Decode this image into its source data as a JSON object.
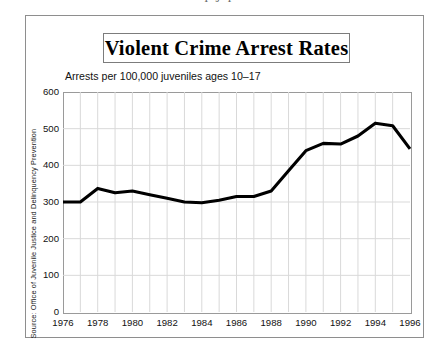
{
  "clipped_header_text": "I  J  I",
  "figure": {
    "title": "Violent Crime Arrest Rates",
    "subtitle": "Arrests per 100,000 juveniles ages 10–17",
    "source_note": "Source: Office of Juvenile Justice and Delinquency Prevention"
  },
  "colors": {
    "line": "#000000",
    "grid": "#d9d9d9",
    "axis": "#9a9a9a",
    "frame": "#8e8e8e",
    "text": "#111111",
    "background": "#ffffff"
  },
  "chart_data": {
    "type": "line",
    "title": "Violent Crime Arrest Rates",
    "subtitle": "Arrests per 100,000 juveniles ages 10–17",
    "xlabel": "",
    "ylabel": "",
    "xlim": [
      1976,
      1996
    ],
    "ylim": [
      0,
      600
    ],
    "ytick_interval": 100,
    "xtick_interval": 2,
    "grid": true,
    "grid_vertical_interval": 1,
    "legend": false,
    "yticks": [
      0,
      100,
      200,
      300,
      400,
      500,
      600
    ],
    "ytick_labels": [
      "0",
      "100",
      "200",
      "300",
      "400",
      "500",
      "600"
    ],
    "xticks": [
      1976,
      1978,
      1980,
      1982,
      1984,
      1986,
      1988,
      1990,
      1992,
      1994,
      1996
    ],
    "xtick_labels": [
      "1976",
      "1978",
      "1980",
      "1982",
      "1984",
      "1986",
      "1988",
      "1990",
      "1992",
      "1994",
      "1996"
    ],
    "x": [
      1976,
      1977,
      1978,
      1979,
      1980,
      1981,
      1982,
      1983,
      1984,
      1985,
      1986,
      1987,
      1988,
      1989,
      1990,
      1991,
      1992,
      1993,
      1994,
      1995,
      1996
    ],
    "values": [
      300,
      300,
      337,
      325,
      330,
      320,
      310,
      300,
      298,
      305,
      315,
      315,
      330,
      385,
      440,
      460,
      458,
      480,
      515,
      508,
      445
    ],
    "series": [
      {
        "name": "Violent crime arrest rate",
        "values": [
          300,
          300,
          337,
          325,
          330,
          320,
          310,
          300,
          298,
          305,
          315,
          315,
          330,
          385,
          440,
          460,
          458,
          480,
          515,
          508,
          445
        ]
      }
    ]
  }
}
